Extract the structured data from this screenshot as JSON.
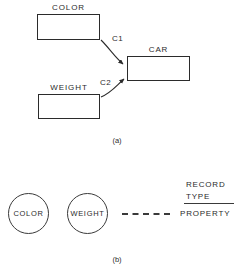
{
  "figure": {
    "panel_a": {
      "entities": [
        {
          "id": "color",
          "label": "COLOR"
        },
        {
          "id": "weight",
          "label": "WEIGHT"
        },
        {
          "id": "car",
          "label": "CAR"
        }
      ],
      "connections": [
        {
          "id": "c1",
          "label": "C1",
          "from": "COLOR",
          "to": "CAR"
        },
        {
          "id": "c2",
          "label": "C2",
          "from": "WEIGHT",
          "to": "CAR"
        }
      ],
      "caption": "(a)"
    },
    "panel_b": {
      "nodes": [
        {
          "id": "color",
          "label": "COLOR"
        },
        {
          "id": "weight",
          "label": "WEIGHT"
        }
      ],
      "legend": {
        "record_type_line1": "RECORD",
        "record_type_line2": "TYPE",
        "property": "PROPERTY"
      },
      "caption": "(b)"
    }
  },
  "colors": {
    "stroke": "#2b2b2b",
    "stroke_light": "#3a3a3a",
    "background": "#ffffff"
  }
}
